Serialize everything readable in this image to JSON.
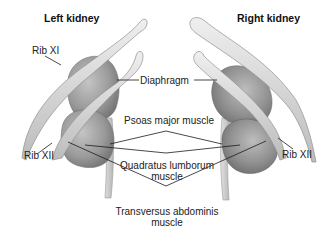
{
  "titles": {
    "left": "Left kidney",
    "right": "Right kidney"
  },
  "labels": {
    "rib_xi": "Rib XI",
    "diaphragm": "Diaphragm",
    "psoas": "Psoas major muscle",
    "rib_xii_left": "Rib XII",
    "rib_xii_right": "Rib XII",
    "quadratus_line1": "Quadratus lumborum",
    "quadratus_line2": "muscle",
    "transversus_line1": "Transversus abdominis",
    "transversus_line2": "muscle"
  },
  "colors": {
    "background": "#ffffff",
    "rib_fill": "#d9d9d9",
    "rib_stroke": "#9a9a9a",
    "kidney_fill": "#a9a9a9",
    "kidney_dark": "#7d7d7d",
    "muscle_fill": "#c8c8c8",
    "leader_line": "#1a1a1a",
    "text": "#222222"
  }
}
